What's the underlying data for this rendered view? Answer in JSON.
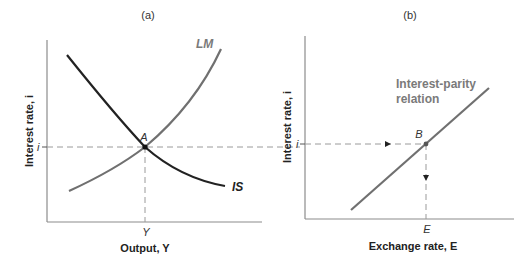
{
  "panel_a": {
    "label": "(a)",
    "y_axis_label": "Interest rate, i",
    "x_axis_label": "Output, Y",
    "y_tick": "i",
    "x_tick": "Y",
    "point_label": "A",
    "curve_lm_label": "LM",
    "curve_is_label": "IS"
  },
  "panel_b": {
    "label": "(b)",
    "y_axis_label": "Interest rate, i",
    "x_axis_label": "Exchange rate, E",
    "y_tick": "i",
    "x_tick": "E",
    "point_label": "B",
    "curve_label_line1": "Interest-parity",
    "curve_label_line2": "relation"
  },
  "colors": {
    "axis": "#8c8c8c",
    "is_curve": "#222222",
    "lm_curve": "#707070",
    "parity_line": "#707070",
    "dashed": "#9a9a9a",
    "label_gray": "#7a7a7a"
  }
}
